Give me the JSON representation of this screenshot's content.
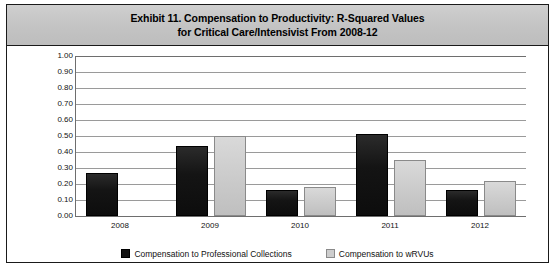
{
  "figure": {
    "title_line_1": "Exhibit 11. Compensation to Productivity: R-Squared Values",
    "title_line_2": "for Critical Care/Intensivist From 2008-12"
  },
  "legend": {
    "items": [
      {
        "label": "Compensation to Professional Collections",
        "swatch": "dark-square-icon",
        "color": "#141414"
      },
      {
        "label": "Compensation to wRVUs",
        "swatch": "light-square-icon",
        "color": "#cdcdcd"
      }
    ]
  },
  "chart_data": {
    "type": "bar",
    "title": "Exhibit 11. Compensation to Productivity: R-Squared Values for Critical Care/Intensivist From 2008-12",
    "xlabel": "",
    "ylabel": "",
    "categories": [
      "2008",
      "2009",
      "2010",
      "2011",
      "2012"
    ],
    "series": [
      {
        "name": "Compensation to Professional Collections",
        "color": "#141414",
        "values": [
          0.27,
          0.44,
          0.16,
          0.51,
          0.16
        ]
      },
      {
        "name": "Compensation to wRVUs",
        "color": "#cdcdcd",
        "values": [
          null,
          0.5,
          0.18,
          0.35,
          0.22
        ]
      }
    ],
    "ylim": [
      0.0,
      1.0
    ],
    "ytick_labels": [
      "1.00",
      "0.90",
      "0.80",
      "0.70",
      "0.60",
      "0.50",
      "0.40",
      "0.30",
      "0.20",
      "0.10",
      "0.00"
    ],
    "ytick_values": [
      1.0,
      0.9,
      0.8,
      0.7,
      0.6,
      0.5,
      0.4,
      0.3,
      0.2,
      0.1,
      0.0
    ],
    "grid": true,
    "legend_position": "bottom"
  }
}
